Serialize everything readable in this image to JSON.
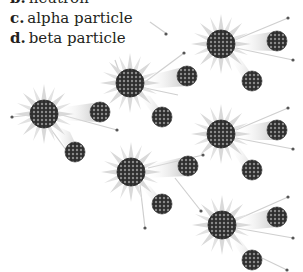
{
  "options": [
    {
      "letter": "b.",
      "text": "neutron"
    },
    {
      "letter": "c.",
      "text": "alpha particle"
    },
    {
      "letter": "d.",
      "text": "beta particle"
    }
  ],
  "figure": {
    "colors": {
      "nucleus": "#3a3a3a",
      "spike": "#d8d8d8",
      "trail": "#c8c8c8",
      "neutron": "#555555"
    }
  }
}
